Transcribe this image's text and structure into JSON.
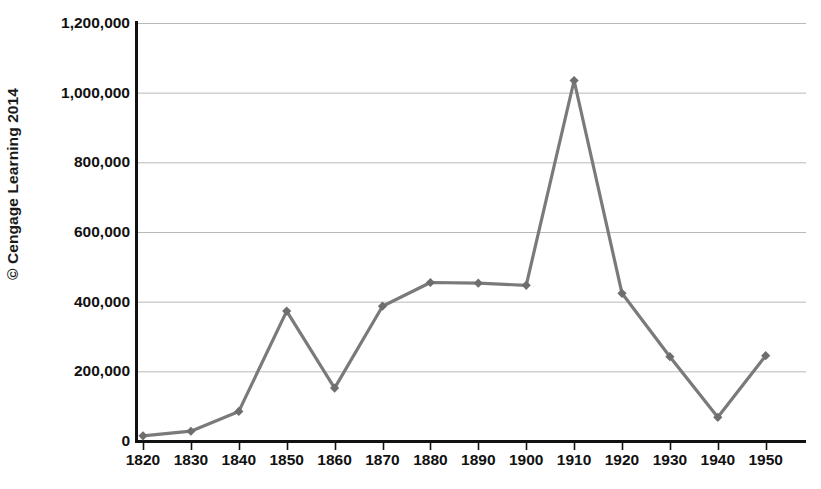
{
  "credit": {
    "text": "© Cengage Learning 2014"
  },
  "chart_data": {
    "type": "line",
    "title": "",
    "subtitle": "",
    "xlabel": "",
    "ylabel": "",
    "categories": [
      "1820",
      "1830",
      "1840",
      "1850",
      "1860",
      "1870",
      "1880",
      "1890",
      "1900",
      "1910",
      "1920",
      "1930",
      "1940",
      "1950"
    ],
    "x": [
      1820,
      1830,
      1840,
      1850,
      1860,
      1870,
      1880,
      1890,
      1900,
      1910,
      1920,
      1930,
      1940,
      1950
    ],
    "values": [
      15000,
      28000,
      85000,
      373000,
      152000,
      387000,
      455000,
      453000,
      447000,
      1035000,
      424000,
      242000,
      68000,
      245000
    ],
    "series": [
      {
        "name": "",
        "values": [
          15000,
          28000,
          85000,
          373000,
          152000,
          387000,
          455000,
          453000,
          447000,
          1035000,
          424000,
          242000,
          68000,
          245000
        ]
      }
    ],
    "ylim": [
      0,
      1200000
    ],
    "ytick_values": [
      0,
      200000,
      400000,
      600000,
      800000,
      1000000,
      1200000
    ],
    "ytick_labels": [
      "0",
      "200,000",
      "400,000",
      "600,000",
      "800,000",
      "1,000,000",
      "1,200,000"
    ],
    "xtick_labels": [
      "1820",
      "1830",
      "1840",
      "1850",
      "1860",
      "1870",
      "1880",
      "1890",
      "1900",
      "1910",
      "1920",
      "1930",
      "1940",
      "1950"
    ],
    "grid": true,
    "grid_axis": "y",
    "legend": false,
    "legend_position": "none",
    "marker": "diamond",
    "line_color": "#7a7a7a",
    "marker_color": "#6e6e6e",
    "grid_color": "#b9b9b9",
    "axis_color": "#111111"
  }
}
